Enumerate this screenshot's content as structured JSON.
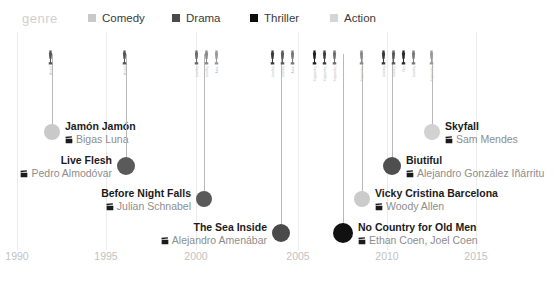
{
  "legend": {
    "title": "genre",
    "items": [
      {
        "label": "Comedy",
        "color": "#c9c9c9",
        "x": 88
      },
      {
        "label": "Drama",
        "color": "#4a4a4a",
        "x": 172
      },
      {
        "label": "Thriller",
        "color": "#0d0d0d",
        "x": 250
      },
      {
        "label": "Action",
        "color": "#d5d5d5",
        "x": 330
      }
    ]
  },
  "axis": {
    "ticks": [
      {
        "label": "1990",
        "x": 17
      },
      {
        "label": "1995",
        "x": 106
      },
      {
        "label": "2000",
        "x": 196
      },
      {
        "label": "2005",
        "x": 298
      },
      {
        "label": "2010",
        "x": 387
      },
      {
        "label": "2015",
        "x": 476
      }
    ]
  },
  "chart_data": {
    "type": "timeline",
    "title": "genre",
    "xlabel": "",
    "ylabel": "",
    "xlim": [
      1990,
      2015
    ],
    "grid": true,
    "legend_position": "top",
    "categories": [
      "Comedy",
      "Drama",
      "Thriller",
      "Action"
    ],
    "category_colors": {
      "Comedy": "#c9c9c9",
      "Drama": "#4a4a4a",
      "Thriller": "#0d0d0d",
      "Action": "#d5d5d5"
    },
    "films": [
      {
        "title": "Jamón Jamón",
        "director": "Bigas Luna",
        "genre": "Comedy",
        "color": "#c9c9c9",
        "x": 52,
        "y": 132,
        "r": 8,
        "stem_top": 22,
        "side": "right",
        "awards": [
          {
            "label": "Award",
            "shade": "#555555"
          }
        ],
        "awards_x": 46,
        "awards_y": 18
      },
      {
        "title": "Live Flesh",
        "director": "Pedro Almodóvar",
        "genre": "Drama",
        "color": "#5a5a5a",
        "x": 126,
        "y": 166,
        "r": 9,
        "stem_top": 22,
        "side": "left",
        "awards": [
          {
            "label": "Award",
            "shade": "#555555"
          }
        ],
        "awards_x": 120,
        "awards_y": 18
      },
      {
        "title": "Before Night Falls",
        "director": "Julian Schnabel",
        "genre": "Drama",
        "color": "#5a5a5a",
        "x": 204,
        "y": 199,
        "r": 8,
        "stem_top": 22,
        "side": "left",
        "awards": [
          {
            "label": "Leading",
            "shade": "#6a6a6a"
          },
          {
            "label": "Leading",
            "shade": "#8a8a8a"
          },
          {
            "label": "Actor",
            "shade": "#9a9a9a"
          }
        ],
        "awards_x": 192,
        "awards_y": 18
      },
      {
        "title": "The Sea Inside",
        "director": "Alejandro Amenábar",
        "genre": "Drama",
        "color": "#4a4a4a",
        "x": 281,
        "y": 233,
        "r": 9,
        "stem_top": 22,
        "side": "left",
        "awards": [
          {
            "label": "Leading",
            "shade": "#3a3a3a"
          },
          {
            "label": "Leading",
            "shade": "#5a5a5a"
          },
          {
            "label": "Actor",
            "shade": "#7a7a7a"
          }
        ],
        "awards_x": 268,
        "awards_y": 18
      },
      {
        "title": "No Country for Old Men",
        "director": "Ethan Coen, Joel Coen",
        "genre": "Thriller",
        "color": "#111111",
        "x": 343,
        "y": 233,
        "r": 10,
        "stem_top": 22,
        "side": "right",
        "awards": [
          {
            "label": "Supporting",
            "shade": "#1f1f1f"
          },
          {
            "label": "Supporting",
            "shade": "#3f3f3f"
          },
          {
            "label": "Supporting",
            "shade": "#6f6f6f"
          }
        ],
        "awards_x": 310,
        "awards_y": 18
      },
      {
        "title": "Vicky Cristina Barcelona",
        "director": "Woody Allen",
        "genre": "Comedy",
        "color": "#cbcbcb",
        "x": 362,
        "y": 199,
        "r": 8,
        "stem_top": 22,
        "side": "right",
        "awards": [
          {
            "label": "Supporting",
            "shade": "#8a8a8a"
          }
        ],
        "awards_x": 357,
        "awards_y": 18
      },
      {
        "title": "Biutiful",
        "director": "Alejandro González Iñárritu",
        "genre": "Drama",
        "color": "#4f4f4f",
        "x": 392,
        "y": 166,
        "r": 9,
        "stem_top": 22,
        "side": "right",
        "awards": [
          {
            "label": "Leading",
            "shade": "#3a3a3a"
          },
          {
            "label": "Leading",
            "shade": "#5a5a5a"
          },
          {
            "label": "Film",
            "shade": "#2a2a2a"
          },
          {
            "label": "Leading",
            "shade": "#7a7a7a"
          }
        ],
        "awards_x": 379,
        "awards_y": 18
      },
      {
        "title": "Skyfall",
        "director": "Sam Mendes",
        "genre": "Action",
        "color": "#d2d2d2",
        "x": 432,
        "y": 132,
        "r": 8,
        "stem_top": 22,
        "side": "right",
        "awards": [
          {
            "label": "Supporting",
            "shade": "#9a9a9a"
          }
        ],
        "awards_x": 427,
        "awards_y": 18
      }
    ]
  }
}
